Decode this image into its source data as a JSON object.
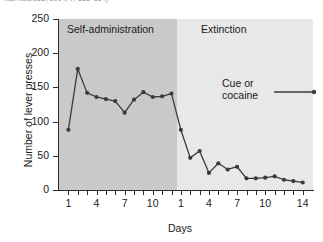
{
  "citation": {
    "text": "Nat Neurosci, 2004, 7, 853–854)"
  },
  "chart_data": {
    "type": "line",
    "title": "",
    "xlabel": "Days",
    "ylabel": "Number of lever presses",
    "ylim": [
      0,
      250
    ],
    "yticks": [
      0,
      50,
      100,
      150,
      200,
      250
    ],
    "grid": false,
    "legend_position": "inside-right",
    "legend": [
      {
        "name": "Cue or cocaine",
        "line_1": "Cue or",
        "line_2": "cocaine",
        "color": "#3a3a3a"
      }
    ],
    "phases": [
      {
        "name": "Self-administration",
        "shade_color": "#c9c9c9",
        "x": [
          1,
          2,
          3,
          4,
          5,
          6,
          7,
          8,
          9,
          10,
          11,
          12
        ],
        "xticks": [
          1,
          2,
          3,
          4,
          5,
          6,
          7,
          8,
          9,
          10,
          11,
          12
        ],
        "xtick_labels": [
          "1",
          "",
          "",
          "4",
          "",
          "",
          "7",
          "",
          "",
          "10",
          "",
          ""
        ],
        "values": [
          88,
          177,
          142,
          136,
          133,
          130,
          113,
          132,
          143,
          136,
          137,
          141
        ]
      },
      {
        "name": "Extinction",
        "shade_color": "#e8e8e8",
        "x": [
          1,
          2,
          3,
          4,
          5,
          6,
          7,
          8,
          9,
          10,
          11,
          12,
          13,
          14
        ],
        "xticks": [
          1,
          2,
          3,
          4,
          5,
          6,
          7,
          8,
          9,
          10,
          11,
          12,
          13,
          14
        ],
        "xtick_labels": [
          "1",
          "",
          "",
          "4",
          "",
          "",
          "7",
          "",
          "",
          "10",
          "",
          "",
          "",
          "14"
        ],
        "values": [
          88,
          47,
          57,
          25,
          39,
          30,
          34,
          17,
          17,
          18,
          20,
          15,
          13,
          11
        ]
      }
    ],
    "series": [
      {
        "name": "Cue or cocaine",
        "color": "#3a3a3a",
        "marker": "circle",
        "values": [
          88,
          177,
          142,
          136,
          133,
          130,
          113,
          132,
          143,
          136,
          137,
          141,
          88,
          47,
          57,
          25,
          39,
          30,
          34,
          17,
          17,
          18,
          20,
          15,
          13,
          11
        ]
      }
    ]
  }
}
